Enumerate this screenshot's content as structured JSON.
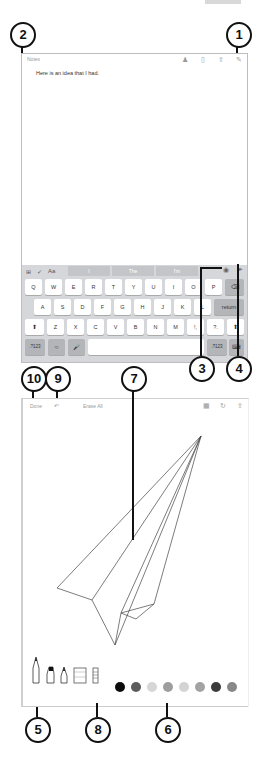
{
  "callouts": {
    "c1": "1",
    "c2": "2",
    "c3": "3",
    "c4": "4",
    "c5": "5",
    "c6": "6",
    "c7": "7",
    "c8": "8",
    "c9": "9",
    "c10": "10"
  },
  "screen1": {
    "back_label": "Notes",
    "toolbar_icons": [
      "people-icon",
      "trash-icon",
      "share-icon",
      "compose-icon"
    ],
    "note_text": "Here is an idea that I had.",
    "keyboard": {
      "bar_left_icons": [
        "table-icon",
        "checklist-icon",
        "format-icon"
      ],
      "suggestions": [
        "I",
        "The",
        "I'm"
      ],
      "bar_right_icons": [
        "camera-icon",
        "sketch-icon"
      ],
      "row1": [
        "Q",
        "W",
        "E",
        "R",
        "T",
        "Y",
        "U",
        "I",
        "O",
        "P"
      ],
      "row2": [
        "A",
        "S",
        "D",
        "F",
        "G",
        "H",
        "J",
        "K",
        "L"
      ],
      "row3": [
        "Z",
        "X",
        "C",
        "V",
        "B",
        "N",
        "M",
        "!,",
        "?."
      ],
      "return_label": "return",
      "numbers_label": ".?123",
      "emoji_icon": "emoji-icon",
      "mic_icon": "microphone-icon",
      "hide_icon": "keyboard-hide-icon",
      "shift_icon": "shift-icon",
      "delete_icon": "delete-icon"
    }
  },
  "screen2": {
    "done_label": "Done",
    "undo_icon": "undo-icon",
    "erase_label": "Erase All",
    "toolbar_icons": [
      "ruler-icon",
      "rotate-icon",
      "share-icon"
    ],
    "tools": [
      "pen-icon",
      "marker-icon",
      "pencil-icon",
      "eraser-icon",
      "ruler-icon"
    ],
    "swatch_colors": [
      "#0b0b0b",
      "#5c5c5c",
      "#d6d6d6",
      "#9e9e9e",
      "#d3d3d3",
      "#a3a3a3",
      "#3a3a3a",
      "#888888"
    ]
  }
}
